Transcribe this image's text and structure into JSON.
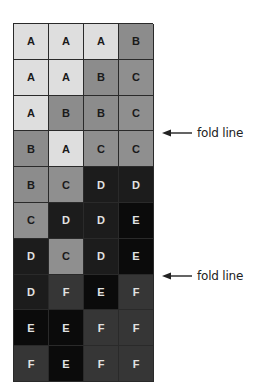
{
  "grid": {
    "columns": 4,
    "rows": [
      [
        "A",
        "A",
        "A",
        "B"
      ],
      [
        "A",
        "A",
        "B",
        "C"
      ],
      [
        "A",
        "B",
        "B",
        "C"
      ],
      [
        "B",
        "A",
        "C",
        "C"
      ],
      [
        "B",
        "C",
        "D",
        "D"
      ],
      [
        "C",
        "D",
        "D",
        "E"
      ],
      [
        "D",
        "C",
        "D",
        "E"
      ],
      [
        "D",
        "F",
        "E",
        "F"
      ],
      [
        "E",
        "E",
        "F",
        "F"
      ],
      [
        "F",
        "E",
        "F",
        "F"
      ]
    ],
    "grade_colors": {
      "A": "#dedede",
      "B": "#8c8c8c",
      "C": "#8f8f8f",
      "D": "#1c1c1c",
      "E": "#0b0b0b",
      "F": "#363636"
    }
  },
  "annotations": [
    {
      "label": "fold line",
      "icon": "left-arrow-icon",
      "after_row": 3
    },
    {
      "label": "fold line",
      "icon": "left-arrow-icon",
      "after_row": 7
    }
  ]
}
